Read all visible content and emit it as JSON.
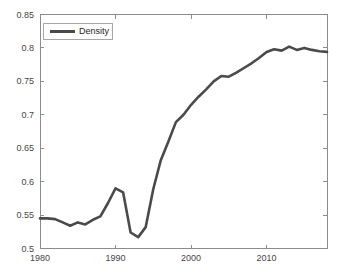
{
  "chart_data": {
    "type": "line",
    "title": "",
    "xlabel": "",
    "ylabel": "",
    "xlim": [
      1980,
      2018
    ],
    "ylim": [
      0.5,
      0.85
    ],
    "xticks": [
      1980,
      1990,
      2000,
      2010
    ],
    "xtick_labels": [
      "1980",
      "1990",
      "2000",
      "2010"
    ],
    "yticks": [
      0.5,
      0.55,
      0.6,
      0.65,
      0.7,
      0.75,
      0.8,
      0.85
    ],
    "ytick_labels": [
      "0.5",
      "0.55",
      "0.6",
      "0.65",
      "0.7",
      "0.75",
      "0.8",
      "0.85"
    ],
    "grid": false,
    "legend_position": "top-left",
    "x": [
      1980,
      1981,
      1982,
      1983,
      1984,
      1985,
      1986,
      1987,
      1988,
      1989,
      1990,
      1991,
      1992,
      1993,
      1994,
      1995,
      1996,
      1997,
      1998,
      1999,
      2000,
      2001,
      2002,
      2003,
      2004,
      2005,
      2006,
      2007,
      2008,
      2009,
      2010,
      2011,
      2012,
      2013,
      2014,
      2015,
      2016,
      2017,
      2018
    ],
    "series": [
      {
        "name": "Density",
        "color": "#4a4a4a",
        "values": [
          0.545,
          0.545,
          0.544,
          0.539,
          0.534,
          0.539,
          0.536,
          0.543,
          0.548,
          0.568,
          0.59,
          0.584,
          0.524,
          0.517,
          0.532,
          0.589,
          0.632,
          0.66,
          0.689,
          0.7,
          0.715,
          0.727,
          0.738,
          0.75,
          0.758,
          0.757,
          0.763,
          0.77,
          0.777,
          0.785,
          0.794,
          0.798,
          0.796,
          0.802,
          0.797,
          0.8,
          0.797,
          0.795,
          0.794
        ]
      }
    ]
  },
  "style": {
    "line_color": "#4a4a4a",
    "axis_color": "#8c8c8c",
    "tick_label_color": "#464646",
    "background_color": "#ffffff",
    "legend_border_color": "#a6a6a6"
  },
  "layout_px": {
    "plot_left": 40,
    "plot_top": 14.5,
    "plot_right": 327,
    "plot_bottom": 248.5
  }
}
